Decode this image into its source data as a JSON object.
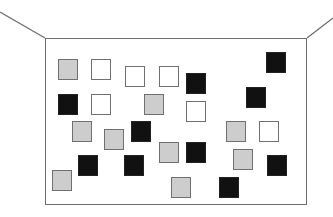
{
  "scene": {
    "description": "Room wall with scattered colored squares",
    "colors": {
      "gray": "#cdcdcd",
      "white": "#ffffff",
      "black": "#111111",
      "line": "#6e6e6e"
    },
    "wall": {
      "x": 45,
      "y": 38,
      "w": 262,
      "h": 167
    },
    "ceiling_lines": [
      {
        "x1": 0,
        "y1": 12,
        "x2": 45,
        "y2": 38
      },
      {
        "x1": 333,
        "y1": 18,
        "x2": 307,
        "y2": 38
      }
    ],
    "squares": [
      {
        "color": "gray",
        "x": 58,
        "y": 59
      },
      {
        "color": "white",
        "x": 91,
        "y": 59
      },
      {
        "color": "white",
        "x": 125,
        "y": 66
      },
      {
        "color": "white",
        "x": 159,
        "y": 66
      },
      {
        "color": "black",
        "x": 186,
        "y": 73
      },
      {
        "color": "black",
        "x": 266,
        "y": 52
      },
      {
        "color": "black",
        "x": 58,
        "y": 94
      },
      {
        "color": "white",
        "x": 91,
        "y": 94
      },
      {
        "color": "gray",
        "x": 144,
        "y": 94
      },
      {
        "color": "white",
        "x": 186,
        "y": 101
      },
      {
        "color": "black",
        "x": 246,
        "y": 87
      },
      {
        "color": "gray",
        "x": 72,
        "y": 121
      },
      {
        "color": "gray",
        "x": 104,
        "y": 129
      },
      {
        "color": "black",
        "x": 131,
        "y": 121
      },
      {
        "color": "gray",
        "x": 226,
        "y": 121
      },
      {
        "color": "white",
        "x": 259,
        "y": 121
      },
      {
        "color": "gray",
        "x": 159,
        "y": 142
      },
      {
        "color": "black",
        "x": 186,
        "y": 142
      },
      {
        "color": "gray",
        "x": 233,
        "y": 149
      },
      {
        "color": "black",
        "x": 78,
        "y": 155
      },
      {
        "color": "black",
        "x": 124,
        "y": 155
      },
      {
        "color": "black",
        "x": 267,
        "y": 155
      },
      {
        "color": "gray",
        "x": 52,
        "y": 170
      },
      {
        "color": "gray",
        "x": 171,
        "y": 177
      },
      {
        "color": "black",
        "x": 219,
        "y": 177
      }
    ],
    "counts": {
      "gray": 10,
      "white": 6,
      "black": 9,
      "total": 25
    }
  }
}
